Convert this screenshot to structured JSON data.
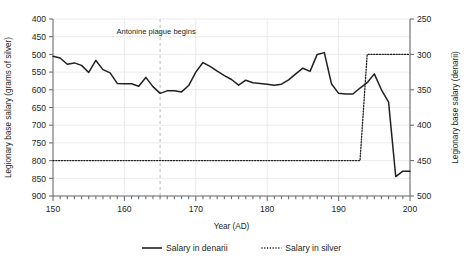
{
  "chart_data": {
    "type": "line",
    "title": "",
    "xlabel": "Year (AD)",
    "ylabel_left": "Legionary base salary (grams of silver)",
    "ylabel_right": "Legionary base salary (denarii)",
    "xlim": [
      150,
      200
    ],
    "ylim_left": [
      400,
      900
    ],
    "ylim_right": [
      250,
      500
    ],
    "xticks": [
      150,
      160,
      170,
      180,
      190,
      200
    ],
    "yticks_left": [
      400,
      450,
      500,
      550,
      600,
      650,
      700,
      750,
      800,
      850,
      900
    ],
    "yticks_right": [
      250,
      300,
      350,
      400,
      450,
      500
    ],
    "grid": true,
    "legend_position": "bottom",
    "annotations": [
      {
        "text": "Antonine plague begins",
        "x": 165,
        "style": "vertical-dashed-line",
        "color": "#b9b9b9"
      }
    ],
    "series": [
      {
        "name": "Salary in denarii",
        "axis": "left",
        "style": "solid",
        "color": "#231f20",
        "x": [
          150,
          151,
          152,
          153,
          154,
          155,
          156,
          157,
          158,
          159,
          160,
          161,
          162,
          163,
          164,
          165,
          166,
          167,
          168,
          169,
          170,
          171,
          172,
          173,
          174,
          175,
          176,
          177,
          178,
          179,
          180,
          181,
          182,
          183,
          184,
          185,
          186,
          187,
          188,
          189,
          190,
          191,
          192,
          193,
          194,
          195,
          196,
          197,
          198,
          199,
          200
        ],
        "values": [
          795,
          790,
          772,
          776,
          769,
          749,
          783,
          757,
          748,
          718,
          717,
          717,
          710,
          735,
          709,
          690,
          697,
          697,
          694,
          712,
          750,
          777,
          766,
          753,
          740,
          729,
          713,
          727,
          720,
          718,
          716,
          713,
          716,
          728,
          745,
          761,
          752,
          800,
          805,
          717,
          690,
          688,
          688,
          705,
          720,
          745,
          700,
          665,
          455,
          470,
          470
        ]
      },
      {
        "name": "Salary in silver",
        "axis": "right",
        "style": "dotted",
        "color": "#231f20",
        "x": [
          150,
          193,
          194,
          200
        ],
        "values": [
          300,
          300,
          450,
          450
        ]
      }
    ]
  },
  "legend": {
    "items": [
      {
        "label": "Salary in denarii",
        "style": "solid"
      },
      {
        "label": "Salary in silver",
        "style": "dotted"
      }
    ]
  },
  "axes": {
    "left_title": "Legionary base salary (grams of silver)",
    "right_title": "Legionary base salary (denarii)",
    "bottom_title": "Year (AD)",
    "left_ticks": [
      "900",
      "850",
      "800",
      "750",
      "700",
      "650",
      "600",
      "550",
      "500",
      "450",
      "400"
    ],
    "right_ticks": [
      "500",
      "450",
      "400",
      "350",
      "300",
      "250"
    ],
    "bottom_ticks": [
      "150",
      "160",
      "170",
      "180",
      "190",
      "200"
    ]
  },
  "annotation": {
    "label": "Antonine plague begins"
  },
  "colors": {
    "line": "#231f20",
    "grid": "#ebebeb",
    "axis": "#6d6e71",
    "marker": "#b9b9b9"
  }
}
